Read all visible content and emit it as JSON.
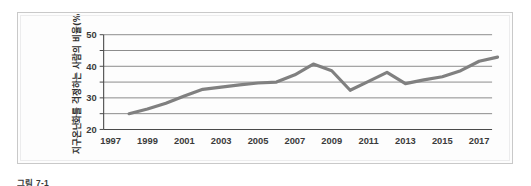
{
  "figure": {
    "caption": "그림 7-1",
    "panel_border_color": "#c9c9c9",
    "background_color": "#ffffff"
  },
  "chart_data": {
    "type": "line",
    "title": "",
    "xlabel": "",
    "ylabel": "지구온난화를 걱정하는 사람의 비율(%)",
    "xlim": [
      1997,
      2018
    ],
    "ylim": [
      20,
      50
    ],
    "grid": true,
    "legend": "none",
    "line_color": "#808080",
    "ytick_labels": [
      "50",
      "40",
      "30",
      "20"
    ],
    "ytick_values": [
      50,
      40,
      30,
      20
    ],
    "gridline_values": [
      50,
      45,
      40,
      35,
      30,
      25,
      20
    ],
    "xtick_labels": [
      "1997",
      "1999",
      "2001",
      "2003",
      "2005",
      "2007",
      "2009",
      "2011",
      "2013",
      "2015",
      "2017"
    ],
    "xtick_values": [
      1997,
      1999,
      2001,
      2003,
      2005,
      2007,
      2009,
      2011,
      2013,
      2015,
      2017
    ],
    "x": [
      1998,
      1999,
      2000,
      2001,
      2002,
      2003,
      2004,
      2005,
      2006,
      2007,
      2008,
      2009,
      2010,
      2011,
      2012,
      2013,
      2014,
      2015,
      2016,
      2017
    ],
    "values": [
      25.0,
      26.5,
      28.3,
      30.6,
      32.7,
      33.4,
      34.1,
      34.7,
      35.0,
      37.3,
      40.7,
      38.6,
      32.4,
      35.2,
      38.1,
      34.5,
      35.7,
      36.7,
      38.6,
      41.6
    ],
    "series": [
      {
        "name": "지구온난화를 걱정하는 사람의 비율(%)",
        "values": [
          25.0,
          26.5,
          28.3,
          30.6,
          32.7,
          33.4,
          34.1,
          34.7,
          35.0,
          37.3,
          40.7,
          38.6,
          32.4,
          35.2,
          38.1,
          34.5,
          35.7,
          36.7,
          38.6,
          41.6
        ]
      }
    ],
    "end_value": 42.9
  }
}
